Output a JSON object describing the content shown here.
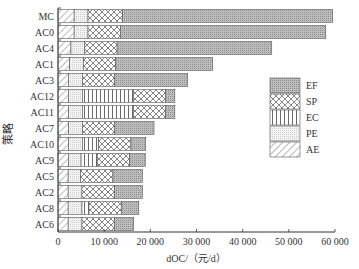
{
  "chart_data": {
    "type": "bar",
    "orientation": "horizontal",
    "stacked": true,
    "title": "",
    "xlabel": "dOC/（元/d）",
    "ylabel": "策略",
    "xlim": [
      0,
      60000
    ],
    "xticks": [
      0,
      10000,
      20000,
      30000,
      40000,
      50000,
      60000
    ],
    "xtick_labels": [
      "0",
      "10 000",
      "20 000",
      "30 000",
      "40 000",
      "50 000",
      "60 000"
    ],
    "grid": false,
    "legend_position": "right-center",
    "categories": [
      "MC",
      "AC0",
      "AC4",
      "AC1",
      "AC3",
      "AC12",
      "AC11",
      "AC7",
      "AC10",
      "AC9",
      "AC5",
      "AC2",
      "AC8",
      "AC6"
    ],
    "series": [
      {
        "name": "AE",
        "values": [
          3500,
          3500,
          2800,
          2500,
          2300,
          2300,
          2300,
          2300,
          2300,
          2300,
          2200,
          2200,
          2200,
          2200
        ]
      },
      {
        "name": "PE",
        "values": [
          3000,
          3000,
          3000,
          3000,
          3000,
          3000,
          3000,
          3000,
          3000,
          2700,
          2700,
          3000,
          3000,
          3000
        ]
      },
      {
        "name": "EC",
        "values": [
          0,
          0,
          0,
          0,
          0,
          11000,
          11000,
          0,
          3500,
          3500,
          0,
          0,
          1500,
          0
        ]
      },
      {
        "name": "SP",
        "values": [
          7500,
          7000,
          7000,
          7000,
          7000,
          7000,
          7000,
          7000,
          7000,
          7000,
          7000,
          7000,
          7000,
          7000
        ]
      },
      {
        "name": "EF",
        "values": [
          45500,
          44500,
          33500,
          21000,
          15800,
          2000,
          2000,
          8500,
          3200,
          3400,
          6400,
          6100,
          3800,
          4200
        ]
      }
    ],
    "legend_order": [
      "EF",
      "SP",
      "EC",
      "PE",
      "AE"
    ]
  }
}
